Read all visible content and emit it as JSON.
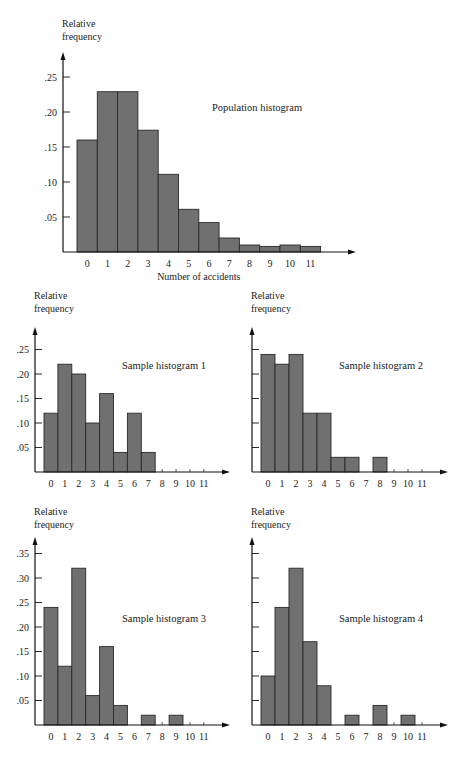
{
  "chart_data": [
    {
      "id": "population",
      "type": "bar",
      "title": "Population histogram",
      "xlabel": "Number of accidents",
      "ylabel": "Relative frequency",
      "categories": [
        "0",
        "1",
        "2",
        "3",
        "4",
        "5",
        "6",
        "7",
        "8",
        "9",
        "10",
        "11"
      ],
      "values": [
        0.16,
        0.229,
        0.229,
        0.174,
        0.111,
        0.061,
        0.042,
        0.02,
        0.01,
        0.008,
        0.01,
        0.008
      ],
      "yticks": [
        ".05",
        ".10",
        ".15",
        ".20",
        ".25"
      ],
      "ylim": [
        0,
        0.28
      ],
      "grid": false
    },
    {
      "id": "sample1",
      "type": "bar",
      "title": "Sample histogram 1",
      "xlabel": "",
      "ylabel": "Relative frequency",
      "categories": [
        "0",
        "1",
        "2",
        "3",
        "4",
        "5",
        "6",
        "7",
        "8",
        "9",
        "10",
        "11"
      ],
      "values": [
        0.12,
        0.22,
        0.2,
        0.1,
        0.16,
        0.04,
        0.12,
        0.04,
        0,
        0,
        0,
        0
      ],
      "yticks": [
        ".05",
        ".10",
        ".15",
        ".20",
        ".25"
      ],
      "ylim": [
        0,
        0.28
      ],
      "grid": false
    },
    {
      "id": "sample2",
      "type": "bar",
      "title": "Sample histogram 2",
      "xlabel": "",
      "ylabel": "Relative frequency",
      "categories": [
        "0",
        "1",
        "2",
        "3",
        "4",
        "5",
        "6",
        "7",
        "8",
        "9",
        "10",
        "11"
      ],
      "values": [
        0.24,
        0.22,
        0.24,
        0.12,
        0.12,
        0.03,
        0.03,
        0,
        0.03,
        0,
        0,
        0
      ],
      "yticks": [
        "",
        "",
        "",
        "",
        ""
      ],
      "ylim": [
        0,
        0.28
      ],
      "grid": false
    },
    {
      "id": "sample3",
      "type": "bar",
      "title": "Sample histogram 3",
      "xlabel": "",
      "ylabel": "Relative frequency",
      "categories": [
        "0",
        "1",
        "2",
        "3",
        "4",
        "5",
        "6",
        "7",
        "8",
        "9",
        "10",
        "11"
      ],
      "values": [
        0.24,
        0.12,
        0.32,
        0.06,
        0.16,
        0.04,
        0,
        0.02,
        0,
        0.02,
        0,
        0
      ],
      "yticks": [
        ".05",
        ".10",
        ".15",
        ".20",
        ".25",
        ".30",
        ".35"
      ],
      "ylim": [
        0,
        0.38
      ],
      "grid": false
    },
    {
      "id": "sample4",
      "type": "bar",
      "title": "Sample histogram 4",
      "xlabel": "",
      "ylabel": "Relative frequency",
      "categories": [
        "0",
        "1",
        "2",
        "3",
        "4",
        "5",
        "6",
        "7",
        "8",
        "9",
        "10",
        "11"
      ],
      "values": [
        0.1,
        0.24,
        0.32,
        0.17,
        0.08,
        0,
        0.02,
        0,
        0.04,
        0,
        0.02,
        0
      ],
      "yticks": [
        "",
        "",
        "",
        "",
        "",
        "",
        ""
      ],
      "ylim": [
        0,
        0.38
      ],
      "grid": false
    }
  ],
  "labels": {
    "ylabel_line1": "Relative",
    "ylabel_line2": "frequency"
  },
  "style": {
    "bar_fill": "#707070",
    "bar_stroke": "#2a2a2a",
    "axis_color": "#111111"
  }
}
